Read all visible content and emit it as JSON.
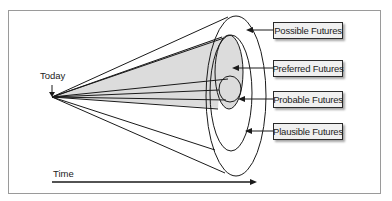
{
  "diagram": {
    "type": "futures-cone",
    "origin_label": "Today",
    "axis_label": "Time",
    "labels": [
      {
        "id": "possible",
        "text": "Possible Futures"
      },
      {
        "id": "preferred",
        "text": "Preferred Futures"
      },
      {
        "id": "probable",
        "text": "Probable Futures"
      },
      {
        "id": "plausible",
        "text": "Plausible Futures"
      }
    ],
    "colors": {
      "stroke": "#1a1a1a",
      "shade": "#d9d9d9",
      "frame": "#9a9a9a",
      "label_bg": "#f0f0f0"
    }
  }
}
